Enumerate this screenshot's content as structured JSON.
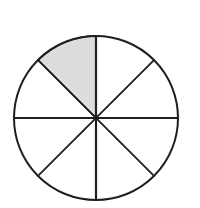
{
  "figure": {
    "name": "circle-divided-into-eight-equal-sectors",
    "caption": "",
    "background_color": "#ffffff",
    "stroke_color": "#1f1f1f",
    "shaded_fill_color": "#dcdcdc",
    "unshaded_fill_color": "#ffffff",
    "circle": {
      "center_x": 96,
      "center_y": 118,
      "radius": 82,
      "outline_width": 2
    },
    "divisions": {
      "total_sectors": 8,
      "sector_angle_degrees": 45,
      "diameter_count": 4,
      "diameter_angles_degrees": [
        0,
        45,
        90,
        135
      ],
      "diameter_line_width": 2
    },
    "sectors": [
      {
        "id": "sector-1",
        "start_angle": 90,
        "end_angle": 135,
        "shaded": true,
        "label": ""
      },
      {
        "id": "sector-2",
        "start_angle": 135,
        "end_angle": 180,
        "shaded": false,
        "label": ""
      },
      {
        "id": "sector-3",
        "start_angle": 180,
        "end_angle": 225,
        "shaded": false,
        "label": ""
      },
      {
        "id": "sector-4",
        "start_angle": 225,
        "end_angle": 270,
        "shaded": false,
        "label": ""
      },
      {
        "id": "sector-5",
        "start_angle": 270,
        "end_angle": 315,
        "shaded": false,
        "label": ""
      },
      {
        "id": "sector-6",
        "start_angle": 315,
        "end_angle": 360,
        "shaded": false,
        "label": ""
      },
      {
        "id": "sector-7",
        "start_angle": 0,
        "end_angle": 45,
        "shaded": false,
        "label": ""
      },
      {
        "id": "sector-8",
        "start_angle": 45,
        "end_angle": 90,
        "shaded": false,
        "label": ""
      }
    ],
    "shaded_count": 1,
    "fraction_shaded": "1/8"
  }
}
